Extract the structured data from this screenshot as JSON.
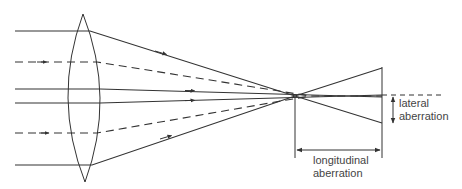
{
  "diagram": {
    "type": "spherical-aberration-lens",
    "labels": {
      "lateral_line1": "lateral",
      "lateral_line2": "aberration",
      "longitudinal_line1": "longitudinal",
      "longitudinal_line2": "aberration"
    },
    "colors": {
      "line": "#333333",
      "text": "#444444",
      "background": "#ffffff"
    },
    "rays": [
      {
        "style": "solid",
        "y_in": 31
      },
      {
        "style": "dashed",
        "y_in": 62
      },
      {
        "style": "solid",
        "y_in": 89
      },
      {
        "style": "solid",
        "y_in": 103
      },
      {
        "style": "dashed",
        "y_in": 133
      },
      {
        "style": "solid",
        "y_in": 165
      }
    ]
  }
}
